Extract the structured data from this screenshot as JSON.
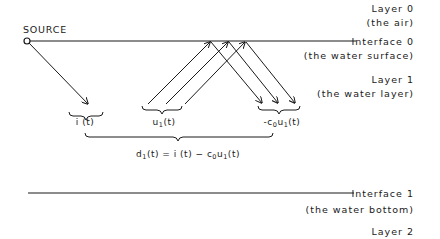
{
  "source": {
    "label": "SOURCE"
  },
  "layers": [
    {
      "name": "Layer 0",
      "desc": "(the air)"
    },
    {
      "name": "Layer 1",
      "desc": "(the water layer)"
    },
    {
      "name": "Layer 2"
    }
  ],
  "interfaces": [
    {
      "name": "Interface 0",
      "desc": "(the water surface)"
    },
    {
      "name": "Interface 1",
      "desc": "(the water bottom)"
    }
  ],
  "signals": {
    "incident": {
      "func": "i",
      "arg": "(t)"
    },
    "upgoing": {
      "func": "u",
      "sub": "1",
      "arg": "(t)"
    },
    "reflected": {
      "prefix": "-c",
      "prefix_sub": "0",
      "func": "u",
      "sub": "1",
      "arg": "(t)"
    },
    "downgoing": {
      "lhs": "d",
      "lhs_sub": "1",
      "lhs_arg": "(t) = i (t) − c",
      "c_sub": "0",
      "u": "u",
      "u_sub": "1",
      "tail": "(t)"
    }
  },
  "colors": {
    "ink": "#1a1a1a",
    "background": "#ffffff"
  }
}
